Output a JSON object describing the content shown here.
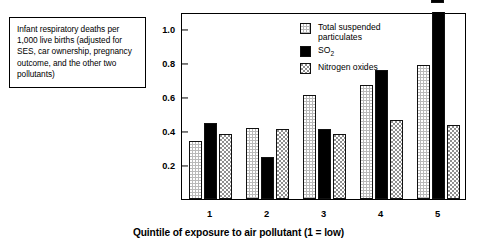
{
  "caption": {
    "text": "Infant respiratory deaths per 1,000 live births (adjusted for SES, car ownership, pregnancy outcome, and the other two pollutants)"
  },
  "legend": {
    "items": [
      {
        "label": "Total suspended\nparticulates",
        "pattern": "dot",
        "color": "#b9b9b9"
      },
      {
        "label": "SO2",
        "label_main": "SO",
        "label_sub": "2",
        "pattern": "solid",
        "color": "#000000"
      },
      {
        "label": "Nitrogen oxides",
        "pattern": "check",
        "color": "#8f8f8f"
      }
    ]
  },
  "chart_data": {
    "type": "bar",
    "title": "",
    "xlabel": "Quintile of exposure to air pollutant (1 = low)",
    "ylabel": "",
    "categories": [
      "1",
      "2",
      "3",
      "4",
      "5"
    ],
    "ylim": [
      0,
      1.1
    ],
    "yticks": [
      0.2,
      0.4,
      0.6,
      0.8,
      1.0
    ],
    "ytick_labels": [
      "0.2",
      "0.4",
      "0.6",
      "0.8",
      "1.0"
    ],
    "grid": false,
    "legend_position": "top-right",
    "series": [
      {
        "name": "Total suspended particulates",
        "pattern": "dot",
        "values": [
          0.34,
          0.42,
          0.61,
          0.67,
          0.79
        ]
      },
      {
        "name": "SO2",
        "pattern": "solid",
        "values": [
          0.45,
          0.25,
          0.41,
          0.76,
          1.75
        ]
      },
      {
        "name": "Nitrogen oxides",
        "pattern": "check",
        "values": [
          0.38,
          0.41,
          0.385,
          0.465,
          0.435
        ]
      }
    ],
    "annotations": [
      {
        "series": "SO2",
        "category": "5",
        "value": 1.75,
        "text": "1.75",
        "clipped": true
      }
    ]
  }
}
